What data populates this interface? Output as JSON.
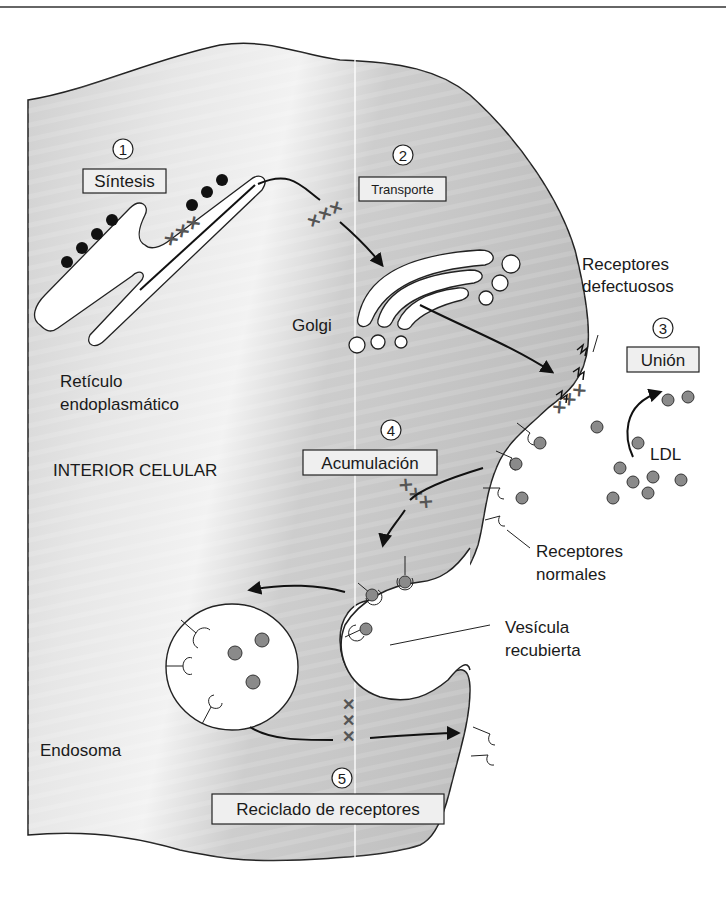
{
  "figure": {
    "colors": {
      "cytoplasm": "#c4c4c4",
      "cytoplasm_light": "#efefef",
      "outline": "#222222",
      "ldl_particle": "#8a8a8a",
      "ribosome": "#111111",
      "marker_x": "#555555"
    }
  },
  "steps": [
    {
      "number": "1",
      "label": "Síntesis"
    },
    {
      "number": "2",
      "label": "Transporte"
    },
    {
      "number": "3",
      "label": "Unión"
    },
    {
      "number": "4",
      "label": "Acumulación"
    },
    {
      "number": "5",
      "label": "Reciclado de receptores"
    }
  ],
  "labels": {
    "golgi": "Golgi",
    "er_line1": "Retículo",
    "er_line2": "endoplasmático",
    "interior": "INTERIOR CELULAR",
    "defective_line1": "Receptores",
    "defective_line2": "defectuosos",
    "ldl": "LDL",
    "normal_line1": "Receptores",
    "normal_line2": "normales",
    "vesicle_line1": "Vesícula",
    "vesicle_line2": "recubierta",
    "endosome": "Endosoma"
  },
  "markers": {
    "blocked_symbol": "XXX"
  }
}
